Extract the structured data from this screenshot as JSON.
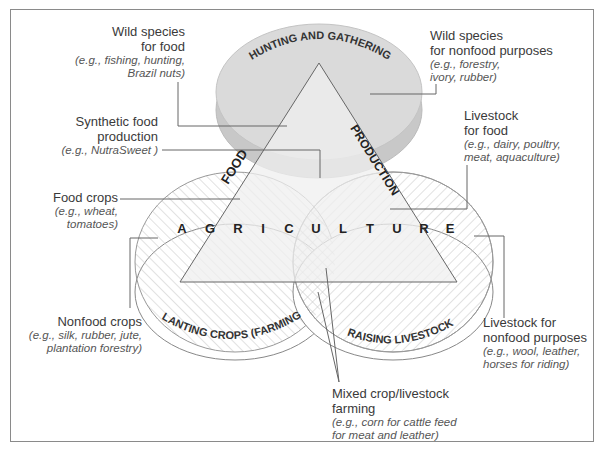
{
  "diagram": {
    "title": "",
    "circles": {
      "top": {
        "label": "HUNTING AND GATHERING",
        "fill": "#d6d6d6",
        "edge": "#c2c2c2"
      },
      "left": {
        "label": "PLANTING CROPS (FARMING)",
        "pattern": "hatch-right"
      },
      "right": {
        "label": "RAISING LIVESTOCK",
        "pattern": "hatch-left"
      }
    },
    "triangle": {
      "left_side": "FOOD",
      "right_side": "PRODUCTION",
      "base": [
        "A",
        "G",
        "R",
        "I",
        "C",
        "U",
        "L",
        "T",
        "U",
        "R",
        "E"
      ],
      "fill": "#efefef"
    },
    "callouts": {
      "wild_food": {
        "title_lines": [
          "Wild species",
          "for food"
        ],
        "example_lines": [
          "(e.g., fishing, hunting,",
          "Brazil nuts)"
        ]
      },
      "synthetic": {
        "title_lines": [
          "Synthetic food",
          "production"
        ],
        "example_lines": [
          "(e.g., NutraSweet )"
        ]
      },
      "food_crops": {
        "title_lines": [
          "Food crops"
        ],
        "example_lines": [
          "(e.g., wheat,",
          "tomatoes)"
        ]
      },
      "nonfood_crops": {
        "title_lines": [
          "Nonfood crops"
        ],
        "example_lines": [
          "(e.g., silk, rubber, jute,",
          "plantation forestry)"
        ]
      },
      "wild_nonfood": {
        "title_lines": [
          "Wild species",
          "for nonfood purposes"
        ],
        "example_lines": [
          "(e.g., forestry,",
          "ivory, rubber)"
        ]
      },
      "livestock_food": {
        "title_lines": [
          "Livestock",
          "for food"
        ],
        "example_lines": [
          "(e.g., dairy, poultry,",
          "meat, aquaculture)"
        ]
      },
      "livestock_nonfood": {
        "title_lines": [
          "Livestock for",
          "nonfood purposes"
        ],
        "example_lines": [
          "(e.g., wool, leather,",
          "horses for riding)"
        ]
      },
      "mixed": {
        "title_lines": [
          "Mixed crop/livestock",
          "farming"
        ],
        "example_lines": [
          "(e.g., corn for cattle feed",
          "for meat and leather)"
        ]
      }
    },
    "colors": {
      "line": "#555555",
      "hatch": "#bdbdbd",
      "frame": "#8a8a8a",
      "text": "#3a3a3a"
    }
  }
}
